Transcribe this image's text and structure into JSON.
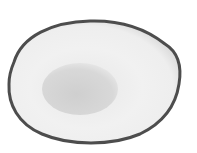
{
  "image": {
    "subject": "halved avocado (grayscale)",
    "colors": {
      "background": "#ffffff",
      "skin": "#4a4a4a",
      "flesh_outer": "#f4f4f4",
      "flesh_inner": "#e6e6e6",
      "pit": "#d2d2d2"
    }
  }
}
